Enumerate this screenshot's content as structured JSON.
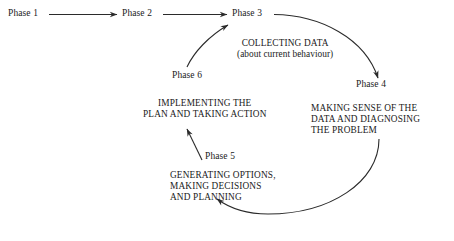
{
  "diagram": {
    "line_color": "#2b2b2b",
    "text_color": "#1a1a1a",
    "background": "#ffffff",
    "linear_phases": [
      {
        "id": "phase-1",
        "label": "Phase 1"
      },
      {
        "id": "phase-2",
        "label": "Phase 2"
      },
      {
        "id": "phase-3",
        "label": "Phase 3"
      }
    ],
    "cycle_phases": [
      {
        "id": "phase-3",
        "label": "Phase 3"
      },
      {
        "id": "phase-4",
        "label": "Phase 4"
      },
      {
        "id": "phase-5",
        "label": "Phase 5"
      },
      {
        "id": "phase-6",
        "label": "Phase 6"
      }
    ],
    "descriptions": {
      "phase_3_line_1": "COLLECTING DATA",
      "phase_3_line_2": "(about current behaviour)",
      "phase_4_line_1": "MAKING SENSE OF THE",
      "phase_4_line_2": "DATA AND DIAGNOSING",
      "phase_4_line_3": "THE PROBLEM",
      "phase_5_line_1": "GENERATING OPTIONS,",
      "phase_5_line_2": "MAKING DECISIONS",
      "phase_5_line_3": "AND PLANNING",
      "phase_6_line_1": "IMPLEMENTING THE",
      "phase_6_line_2": "PLAN AND TAKING ACTION"
    },
    "connectors": [
      {
        "id": "arrow-phase1-phase2",
        "from": "Phase 1",
        "to": "Phase 2",
        "shape": "straight",
        "direction": "right"
      },
      {
        "id": "arrow-phase2-phase3",
        "from": "Phase 2",
        "to": "Phase 3",
        "shape": "straight",
        "direction": "right"
      },
      {
        "id": "arrow-phase3-phase4",
        "from": "Phase 3",
        "to": "Phase 4",
        "shape": "curved",
        "direction": "down"
      },
      {
        "id": "arrow-phase4-phase5",
        "from": "Phase 4",
        "to": "Phase 5",
        "shape": "curved",
        "direction": "left"
      },
      {
        "id": "arrow-phase5-phase6",
        "from": "Phase 5",
        "to": "Phase 6",
        "shape": "straight",
        "direction": "up"
      },
      {
        "id": "arrow-phase6-phase3",
        "from": "Phase 6",
        "to": "Phase 3",
        "shape": "curved",
        "direction": "up-right"
      }
    ]
  }
}
